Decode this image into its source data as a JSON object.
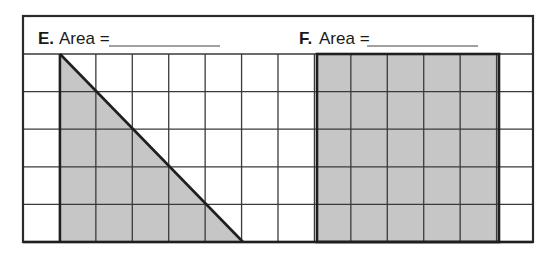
{
  "problems": [
    {
      "letter": "E.",
      "prompt": "Area =",
      "answer": "",
      "shape": "right-triangle",
      "legs_units": [
        5,
        5
      ]
    },
    {
      "letter": "F.",
      "prompt": "Area =",
      "answer": "",
      "shape": "rectangle",
      "width_units": 5,
      "height_units": 5
    }
  ],
  "grid": {
    "columns": 14,
    "rows": 5
  },
  "colors": {
    "shade": "#c6c6c6",
    "line": "#333333",
    "thick": "#1f1f1f"
  }
}
